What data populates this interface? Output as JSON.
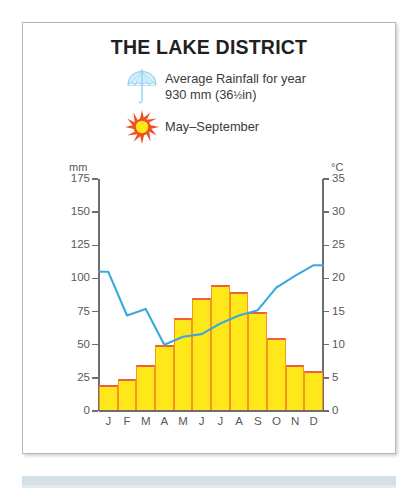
{
  "title": "THE LAKE DISTRICT",
  "legend": [
    {
      "icon": "umbrella-icon",
      "line1": "Average Rainfall for year",
      "line2_pre": "930 mm (36",
      "line2_frac": "½",
      "line2_post": "in)"
    },
    {
      "icon": "sun-icon",
      "line1": "May–September",
      "line2_pre": "",
      "line2_frac": "",
      "line2_post": ""
    }
  ],
  "colors": {
    "bar_fill": "#ffe81a",
    "bar_outline": "#f15f3a",
    "bar_separator": "#f7941e",
    "temp_line": "#3aa8dd",
    "axis": "#6d6e71",
    "panel_border": "#b7b7b7",
    "title_text": "#231f20",
    "umbrella": "#8fd3ef",
    "sun_center": "#ffe81a",
    "sun_rays": "#f04e23",
    "bottom_band": "#ccd9e2"
  },
  "chart_data": {
    "type": "bar",
    "title": "THE LAKE DISTRICT",
    "categories": [
      "J",
      "F",
      "M",
      "A",
      "M",
      "J",
      "J",
      "A",
      "S",
      "O",
      "N",
      "D"
    ],
    "month_names": [
      "January",
      "February",
      "March",
      "April",
      "May",
      "June",
      "July",
      "August",
      "September",
      "October",
      "November",
      "December"
    ],
    "series": [
      {
        "name": "Rainfall",
        "unit": "mm",
        "axis": "left",
        "chart_type": "bar",
        "values": [
          20,
          24,
          35,
          50,
          70,
          85,
          95,
          90,
          75,
          55,
          35,
          30
        ]
      },
      {
        "name": "Temperature",
        "unit": "°C",
        "axis": "right",
        "chart_type": "line",
        "values": [
          21.0,
          14.4,
          15.4,
          10.0,
          11.2,
          11.6,
          13.2,
          14.4,
          15.2,
          18.6,
          20.4,
          22.0
        ]
      }
    ],
    "xlabel": "",
    "ylabel": "mm",
    "y2label": "°C",
    "ylim": [
      0,
      175
    ],
    "y2lim": [
      0,
      35
    ],
    "yticks": [
      0,
      25,
      50,
      75,
      100,
      125,
      150,
      175
    ],
    "y2ticks": [
      0,
      5,
      10,
      15,
      20,
      25,
      30,
      35
    ],
    "grid": false,
    "legend_position": "top-center",
    "annotations": [
      "Average Rainfall for year 930 mm (36½in)",
      "May–September"
    ]
  },
  "axes": {
    "left_unit": "mm",
    "right_unit": "°C",
    "left_ticks": [
      "175",
      "150",
      "125",
      "100",
      "75",
      "50",
      "25",
      "0"
    ],
    "right_ticks": [
      "35",
      "30",
      "25",
      "20",
      "15",
      "10",
      "5",
      "0"
    ]
  }
}
